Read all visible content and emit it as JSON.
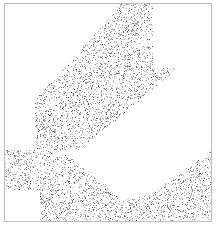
{
  "image": {
    "description": "stippled abstract pattern in a square frame with blank geometric regions",
    "width": 219,
    "height": 227,
    "frame": {
      "x": 4,
      "y": 3,
      "w": 208,
      "h": 219,
      "border_color": "#bdbdbd"
    },
    "dot_color": "#555555",
    "dot_count": 5200,
    "seed": 7,
    "blank_regions": [
      {
        "type": "poly",
        "points": [
          [
            5,
            4
          ],
          [
            120,
            4
          ],
          [
            120,
            6
          ],
          [
            90,
            40
          ],
          [
            35,
            100
          ],
          [
            35,
            150
          ],
          [
            5,
            150
          ]
        ],
        "comment": "top-left wedge"
      },
      {
        "type": "rect",
        "x": 153,
        "y": 4,
        "w": 59,
        "h": 64,
        "comment": "top-right block"
      },
      {
        "type": "poly",
        "points": [
          [
            35,
            150
          ],
          [
            80,
            150
          ],
          [
            212,
            40
          ],
          [
            212,
            68
          ],
          [
            212,
            150
          ],
          [
            150,
            195
          ],
          [
            120,
            200
          ],
          [
            100,
            180
          ],
          [
            60,
            150
          ]
        ],
        "comment": "diagonal empty band"
      },
      {
        "type": "rect",
        "x": 5,
        "y": 190,
        "w": 35,
        "h": 31,
        "comment": "bottom-left block"
      }
    ]
  }
}
